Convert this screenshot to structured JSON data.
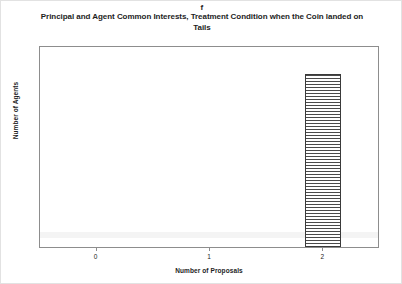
{
  "panel": {
    "label": "f"
  },
  "titles": {
    "main": "Principal and Agent Common Interests, Treatment Condition when the Coin landed on Tails"
  },
  "axes": {
    "ylabel": "Number of Agents",
    "xlabel": "Number of Proposals"
  },
  "colors": {
    "bar_line": "#4a4a4a",
    "bar_border": "#3a3a3a",
    "frame": "#8d8d8d",
    "text": "#1d1d1d",
    "background": "#ffffff"
  },
  "chart_data": {
    "type": "bar",
    "title": "Principal and Agent Common Interests, Treatment Condition when the Coin landed on Tails",
    "panel_label": "f",
    "xlabel": "Number of Proposals",
    "ylabel": "Number of Agents",
    "categories": [
      "0",
      "1",
      "2"
    ],
    "values": [
      0,
      0,
      12
    ],
    "ylim": [
      0,
      14
    ],
    "ytick_values": [
      0,
      2,
      4,
      6,
      8,
      10,
      12,
      14
    ],
    "ytick_labels": [
      "0",
      "2",
      "4",
      "6",
      "8",
      "10",
      "12",
      "14"
    ],
    "xtick_labels": [
      "0",
      "1",
      "2"
    ],
    "grid": false,
    "legend": null,
    "bar_fill": "horizontal-hatch",
    "series": [
      {
        "name": "Number of Agents",
        "values": [
          0,
          0,
          12
        ]
      }
    ]
  }
}
